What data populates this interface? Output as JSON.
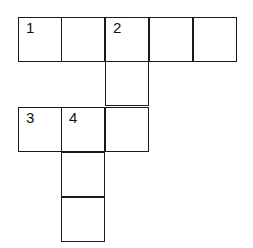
{
  "puzzle": {
    "cells": [
      {
        "row": 0,
        "col": 0,
        "number": "1"
      },
      {
        "row": 0,
        "col": 1,
        "number": ""
      },
      {
        "row": 0,
        "col": 2,
        "number": "2"
      },
      {
        "row": 0,
        "col": 3,
        "number": ""
      },
      {
        "row": 0,
        "col": 4,
        "number": ""
      },
      {
        "row": 1,
        "col": 2,
        "number": ""
      },
      {
        "row": 2,
        "col": 0,
        "number": "3"
      },
      {
        "row": 2,
        "col": 1,
        "number": "4"
      },
      {
        "row": 2,
        "col": 2,
        "number": ""
      },
      {
        "row": 3,
        "col": 1,
        "number": ""
      },
      {
        "row": 4,
        "col": 1,
        "number": ""
      }
    ]
  }
}
